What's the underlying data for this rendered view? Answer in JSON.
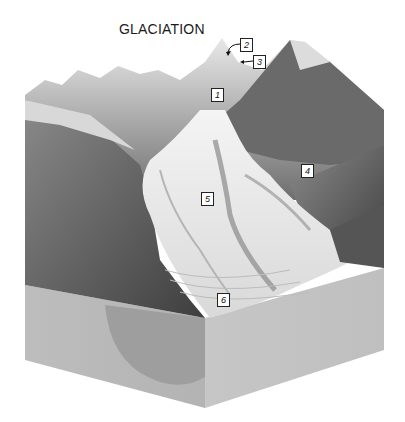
{
  "diagram": {
    "title": "GLACIATION",
    "labels": [
      {
        "id": "1",
        "x": 211,
        "y": 88
      },
      {
        "id": "2",
        "x": 240,
        "y": 38
      },
      {
        "id": "3",
        "x": 253,
        "y": 55
      },
      {
        "id": "4",
        "x": 301,
        "y": 164
      },
      {
        "id": "5",
        "x": 201,
        "y": 192
      },
      {
        "id": "6",
        "x": 217,
        "y": 293
      }
    ],
    "colors": {
      "background": "#ffffff",
      "block_left_face": "#b9b9b9",
      "block_right_face": "#c4c4c4",
      "ice_trough": "#9e9e9e",
      "ice": "#eaeaea",
      "rock_dark": "#4a4a4a",
      "rock_mid": "#7a7a7a"
    }
  }
}
